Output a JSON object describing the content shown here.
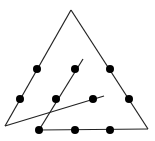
{
  "diagram": {
    "colors": {
      "stroke": "#222222",
      "dot": "#000000",
      "background": "#ffffff"
    },
    "triangle": {
      "apex": [
        71,
        10
      ],
      "left": [
        5,
        126
      ],
      "right": [
        148,
        129
      ]
    },
    "bottom_edge": {
      "from": [
        39,
        130
      ],
      "to": [
        148,
        129
      ]
    },
    "left_edge": {
      "from": [
        71,
        10
      ],
      "to": [
        5,
        126
      ]
    },
    "right_edge": {
      "from": [
        71,
        10
      ],
      "to": [
        148,
        129
      ]
    },
    "inner_line": {
      "from": [
        39,
        130
      ],
      "to": [
        83,
        59
      ]
    },
    "cross_line": {
      "from": [
        5,
        126
      ],
      "to": [
        104,
        96
      ]
    },
    "dots": [
      {
        "x": 37,
        "y": 69
      },
      {
        "x": 75,
        "y": 69
      },
      {
        "x": 110,
        "y": 69
      },
      {
        "x": 20,
        "y": 99
      },
      {
        "x": 56,
        "y": 99
      },
      {
        "x": 93,
        "y": 99
      },
      {
        "x": 129,
        "y": 99
      },
      {
        "x": 39,
        "y": 130
      },
      {
        "x": 75,
        "y": 130
      },
      {
        "x": 110,
        "y": 130
      }
    ]
  }
}
